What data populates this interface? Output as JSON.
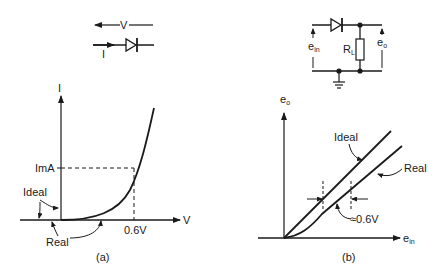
{
  "figure_a": {
    "caption": "(a)",
    "symbol": {
      "voltage_label": "V",
      "current_label": "I",
      "component": "diode-icon"
    },
    "axes": {
      "x_label": "V",
      "y_label": "I"
    },
    "annotations": {
      "current_marker": "ImA",
      "voltage_marker": "0.6V",
      "ideal_label": "Ideal",
      "real_label": "Real"
    }
  },
  "figure_b": {
    "caption": "(b)",
    "circuit": {
      "input_label": "e",
      "input_sub": "in",
      "output_label": "e",
      "output_sub": "o",
      "resistor_label": "R",
      "resistor_sub": "L",
      "components": [
        "diode-icon",
        "resistor-icon",
        "ground-icon"
      ]
    },
    "axes": {
      "x_label": "e",
      "x_sub": "in",
      "y_label": "e",
      "y_sub": "o"
    },
    "annotations": {
      "ideal_label": "Ideal",
      "real_label": "Real",
      "offset_label": "≈0.6V"
    }
  }
}
